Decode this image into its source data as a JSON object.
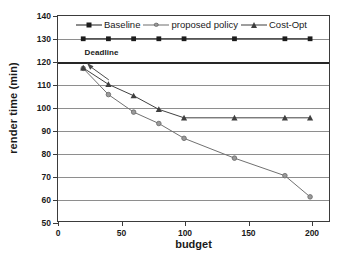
{
  "chart_data": {
    "type": "line",
    "title": "",
    "xlabel": "budget",
    "ylabel": "render time (min)",
    "xlim": [
      0,
      215
    ],
    "ylim": [
      50,
      140
    ],
    "xticks": [
      0,
      50,
      100,
      150,
      200
    ],
    "yticks": [
      50,
      60,
      70,
      80,
      90,
      100,
      110,
      120,
      130,
      140
    ],
    "grid": "horizontal",
    "legend_position": "top-inside",
    "annotations": [
      {
        "text": "Deadline",
        "x": 24,
        "y": 122,
        "points_to_x": 23,
        "points_to_y": 120,
        "kind": "arrow-to-threshold-line"
      }
    ],
    "threshold_line": {
      "label": "Deadline",
      "value": 120,
      "orientation": "horizontal",
      "color": "#262626"
    },
    "x": [
      20,
      40,
      60,
      80,
      100,
      140,
      180,
      200
    ],
    "series": [
      {
        "name": "Baseline",
        "marker": "square",
        "color": "#1c1c1c",
        "values": [
          130,
          130,
          130,
          130,
          130,
          130,
          130,
          130
        ]
      },
      {
        "name": "proposed policy",
        "marker": "circle",
        "color": "#6e6e6e",
        "values": [
          117,
          105.5,
          97.8,
          92.8,
          86.3,
          77.6,
          69.9,
          60.6
        ]
      },
      {
        "name": "Cost-Opt",
        "marker": "triangle",
        "color": "#3f3f3f",
        "values": [
          117.2,
          110,
          105,
          99,
          95.3,
          95.3,
          95.3,
          95.3
        ]
      }
    ]
  },
  "legend": {
    "entries": [
      {
        "label": "Baseline"
      },
      {
        "label": "proposed policy"
      },
      {
        "label": "Cost-Opt"
      }
    ]
  },
  "axis": {
    "x_title": "budget",
    "y_title": "render time (min)",
    "x_tick_labels": [
      "0",
      "50",
      "100",
      "150",
      "200"
    ],
    "y_tick_labels": [
      "140",
      "130",
      "120",
      "110",
      "100",
      "90",
      "80",
      "70",
      "60",
      "50"
    ]
  },
  "colors": {
    "baseline": "#1c1c1c",
    "proposed_policy": "#6e6e6e",
    "cost_opt": "#3f3f3f",
    "gridline": "#8e8e8e",
    "deadline_line": "#262626",
    "frame": "#3b3b3b",
    "background": "#ffffff"
  }
}
